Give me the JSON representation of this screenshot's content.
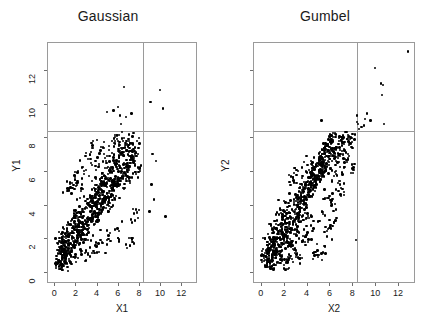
{
  "figure": {
    "background": "#ffffff",
    "point_color": "#000000",
    "axis_color": "#9a9a9a"
  },
  "chart_data": [
    {
      "type": "scatter",
      "title": "Gaussian",
      "xlabel": "X1",
      "ylabel": "Y1",
      "xlim": [
        -0.6,
        13.4
      ],
      "ylim": [
        -0.6,
        13.6
      ],
      "xticks": [
        0,
        2,
        4,
        6,
        8,
        10,
        12
      ],
      "yticks": [
        0,
        2,
        4,
        6,
        8,
        10,
        12
      ],
      "grid": false,
      "legend": "none",
      "annotations": [
        {
          "type": "vline",
          "x": 8.4,
          "color": "#9a9a9a"
        },
        {
          "type": "hline",
          "y": 8.4,
          "color": "#9a9a9a"
        }
      ],
      "n_points": 1000,
      "points": [
        [
          0.5,
          0.6
        ],
        [
          0.6,
          0.4
        ],
        [
          0.7,
          0.9
        ],
        [
          0.4,
          0.7
        ],
        [
          0.9,
          1.1
        ],
        [
          1.1,
          0.8
        ],
        [
          0.8,
          1.3
        ],
        [
          1.2,
          1.0
        ],
        [
          0.3,
          0.5
        ],
        [
          0.6,
          1.2
        ],
        [
          1.0,
          1.5
        ],
        [
          1.4,
          1.1
        ],
        [
          0.9,
          0.6
        ],
        [
          1.3,
          1.6
        ],
        [
          0.7,
          1.8
        ],
        [
          1.6,
          1.2
        ],
        [
          1.1,
          2.0
        ],
        [
          1.8,
          1.5
        ],
        [
          1.5,
          2.2
        ],
        [
          2.0,
          1.8
        ],
        [
          1.2,
          2.4
        ],
        [
          2.2,
          2.0
        ],
        [
          1.7,
          2.6
        ],
        [
          2.4,
          2.2
        ],
        [
          1.4,
          1.4
        ],
        [
          2.1,
          2.5
        ],
        [
          1.9,
          3.0
        ],
        [
          2.6,
          2.4
        ],
        [
          2.3,
          2.8
        ],
        [
          2.8,
          2.6
        ],
        [
          2.0,
          3.2
        ],
        [
          3.0,
          2.9
        ],
        [
          2.5,
          3.4
        ],
        [
          3.2,
          3.0
        ],
        [
          2.7,
          3.6
        ],
        [
          3.4,
          3.2
        ],
        [
          2.9,
          2.2
        ],
        [
          3.6,
          3.4
        ],
        [
          3.1,
          3.8
        ],
        [
          3.8,
          3.6
        ],
        [
          3.3,
          2.6
        ],
        [
          4.0,
          3.9
        ],
        [
          3.5,
          4.2
        ],
        [
          4.2,
          3.5
        ],
        [
          3.7,
          4.4
        ],
        [
          4.4,
          4.0
        ],
        [
          3.9,
          4.6
        ],
        [
          4.6,
          4.2
        ],
        [
          4.1,
          3.1
        ],
        [
          4.8,
          4.5
        ],
        [
          4.3,
          5.0
        ],
        [
          5.0,
          4.4
        ],
        [
          4.5,
          5.2
        ],
        [
          5.2,
          4.8
        ],
        [
          4.7,
          5.4
        ],
        [
          5.4,
          5.0
        ],
        [
          4.9,
          3.8
        ],
        [
          5.6,
          5.3
        ],
        [
          5.1,
          5.8
        ],
        [
          5.8,
          5.1
        ],
        [
          5.3,
          6.0
        ],
        [
          6.0,
          5.6
        ],
        [
          5.5,
          6.2
        ],
        [
          6.2,
          5.4
        ],
        [
          5.7,
          4.4
        ],
        [
          6.4,
          6.1
        ],
        [
          5.9,
          6.6
        ],
        [
          6.6,
          5.9
        ],
        [
          6.1,
          6.8
        ],
        [
          6.8,
          6.4
        ],
        [
          6.3,
          7.0
        ],
        [
          7.0,
          6.2
        ],
        [
          6.5,
          5.0
        ],
        [
          7.2,
          6.9
        ],
        [
          6.7,
          7.4
        ],
        [
          7.4,
          6.7
        ],
        [
          6.9,
          7.6
        ],
        [
          7.6,
          7.2
        ],
        [
          7.1,
          5.6
        ],
        [
          7.8,
          3.5
        ],
        [
          8.1,
          6.2
        ],
        [
          7.3,
          2.0
        ],
        [
          6.0,
          2.0
        ],
        [
          5.0,
          1.9
        ],
        [
          4.0,
          1.5
        ],
        [
          3.0,
          1.2
        ],
        [
          2.0,
          0.9
        ],
        [
          1.0,
          0.5
        ],
        [
          5.6,
          9.6
        ],
        [
          6.0,
          9.8
        ],
        [
          6.2,
          9.3
        ],
        [
          6.6,
          11.0
        ],
        [
          6.3,
          8.8
        ],
        [
          7.3,
          9.4
        ],
        [
          5.0,
          9.5
        ],
        [
          6.8,
          9.2
        ],
        [
          9.1,
          10.1
        ],
        [
          10.0,
          10.8
        ],
        [
          10.3,
          9.7
        ],
        [
          9.3,
          7.0
        ],
        [
          9.6,
          6.6
        ],
        [
          9.2,
          5.2
        ],
        [
          9.4,
          4.3
        ],
        [
          9.0,
          3.6
        ],
        [
          10.5,
          3.3
        ],
        [
          6.4,
          8.3
        ],
        [
          5.9,
          8.1
        ],
        [
          7.0,
          7.9
        ],
        [
          7.5,
          7.3
        ],
        [
          6.1,
          7.6
        ],
        [
          4.6,
          7.4
        ],
        [
          3.6,
          7.5
        ],
        [
          2.2,
          5.3
        ],
        [
          1.5,
          5.3
        ],
        [
          2.8,
          6.0
        ],
        [
          3.2,
          6.7
        ],
        [
          4.2,
          6.3
        ],
        [
          5.2,
          6.9
        ],
        [
          2.5,
          4.8
        ],
        [
          3.9,
          5.6
        ]
      ]
    },
    {
      "type": "scatter",
      "title": "Gumbel",
      "xlabel": "X2",
      "ylabel": "Y2",
      "xlim": [
        -0.6,
        13.4
      ],
      "ylim": [
        -0.6,
        13.6
      ],
      "xticks": [
        0,
        2,
        4,
        6,
        8,
        10,
        12
      ],
      "yticks": [
        0,
        2,
        4,
        6,
        8,
        10,
        12
      ],
      "grid": false,
      "legend": "none",
      "annotations": [
        {
          "type": "vline",
          "x": 8.4,
          "color": "#9a9a9a"
        },
        {
          "type": "hline",
          "y": 8.4,
          "color": "#9a9a9a"
        }
      ],
      "n_points": 1000,
      "points": [
        [
          0.4,
          0.3
        ],
        [
          0.6,
          0.6
        ],
        [
          0.8,
          0.5
        ],
        [
          0.5,
          0.9
        ],
        [
          1.0,
          0.8
        ],
        [
          0.7,
          1.2
        ],
        [
          1.2,
          1.0
        ],
        [
          0.9,
          1.5
        ],
        [
          1.4,
          1.2
        ],
        [
          1.1,
          1.8
        ],
        [
          1.6,
          1.5
        ],
        [
          1.3,
          2.0
        ],
        [
          1.8,
          1.7
        ],
        [
          1.5,
          2.3
        ],
        [
          2.0,
          1.9
        ],
        [
          1.7,
          2.5
        ],
        [
          2.2,
          2.1
        ],
        [
          1.9,
          2.8
        ],
        [
          2.4,
          2.4
        ],
        [
          2.1,
          3.0
        ],
        [
          2.6,
          2.6
        ],
        [
          2.3,
          3.2
        ],
        [
          2.8,
          2.9
        ],
        [
          2.5,
          3.5
        ],
        [
          3.0,
          3.1
        ],
        [
          2.7,
          3.7
        ],
        [
          3.2,
          3.3
        ],
        [
          2.9,
          4.0
        ],
        [
          3.4,
          3.6
        ],
        [
          3.1,
          4.2
        ],
        [
          3.6,
          3.8
        ],
        [
          3.3,
          4.4
        ],
        [
          3.8,
          4.1
        ],
        [
          3.5,
          4.7
        ],
        [
          4.0,
          4.3
        ],
        [
          3.7,
          4.9
        ],
        [
          4.2,
          4.5
        ],
        [
          3.9,
          5.2
        ],
        [
          4.4,
          4.8
        ],
        [
          4.1,
          5.4
        ],
        [
          4.6,
          5.0
        ],
        [
          4.3,
          5.6
        ],
        [
          4.8,
          5.3
        ],
        [
          4.5,
          5.9
        ],
        [
          5.0,
          5.5
        ],
        [
          4.7,
          6.1
        ],
        [
          5.2,
          5.7
        ],
        [
          4.9,
          6.3
        ],
        [
          5.4,
          6.0
        ],
        [
          5.1,
          6.6
        ],
        [
          5.6,
          6.2
        ],
        [
          5.3,
          6.8
        ],
        [
          5.8,
          6.4
        ],
        [
          5.5,
          7.0
        ],
        [
          6.0,
          6.7
        ],
        [
          5.7,
          7.3
        ],
        [
          6.2,
          6.9
        ],
        [
          5.9,
          7.5
        ],
        [
          6.4,
          7.1
        ],
        [
          6.1,
          7.7
        ],
        [
          6.6,
          7.4
        ],
        [
          6.3,
          8.0
        ],
        [
          6.8,
          7.6
        ],
        [
          6.5,
          8.2
        ],
        [
          7.0,
          7.8
        ],
        [
          6.7,
          6.5
        ],
        [
          7.2,
          8.1
        ],
        [
          6.9,
          5.4
        ],
        [
          7.4,
          8.3
        ],
        [
          7.1,
          7.2
        ],
        [
          7.6,
          7.0
        ],
        [
          7.3,
          6.2
        ],
        [
          7.8,
          7.9
        ],
        [
          7.5,
          8.3
        ],
        [
          8.0,
          7.7
        ],
        [
          8.2,
          6.4
        ],
        [
          8.3,
          1.9
        ],
        [
          5.3,
          9.0
        ],
        [
          8.4,
          9.3
        ],
        [
          8.4,
          8.9
        ],
        [
          8.5,
          8.8
        ],
        [
          8.8,
          8.6
        ],
        [
          9.1,
          9.1
        ],
        [
          9.3,
          9.4
        ],
        [
          9.6,
          9.0
        ],
        [
          10.0,
          12.1
        ],
        [
          10.5,
          11.2
        ],
        [
          10.7,
          11.1
        ],
        [
          10.6,
          10.5
        ],
        [
          10.8,
          8.8
        ],
        [
          12.9,
          13.1
        ],
        [
          8.6,
          8.5
        ],
        [
          9.0,
          8.7
        ],
        [
          6.0,
          2.6
        ],
        [
          5.6,
          1.5
        ],
        [
          4.8,
          1.0
        ],
        [
          3.4,
          0.8
        ],
        [
          2.4,
          0.6
        ],
        [
          1.2,
          0.4
        ],
        [
          2.0,
          0.2
        ],
        [
          3.0,
          1.4
        ],
        [
          4.0,
          2.2
        ],
        [
          5.0,
          3.0
        ],
        [
          6.2,
          4.0
        ],
        [
          2.8,
          5.6
        ],
        [
          3.6,
          6.2
        ],
        [
          4.4,
          6.6
        ],
        [
          2.0,
          4.2
        ],
        [
          1.6,
          3.4
        ],
        [
          1.0,
          2.6
        ],
        [
          6.6,
          5.8
        ],
        [
          7.0,
          5.0
        ],
        [
          5.8,
          4.4
        ],
        [
          4.2,
          3.2
        ],
        [
          3.2,
          2.4
        ],
        [
          2.6,
          1.6
        ],
        [
          1.4,
          1.0
        ],
        [
          0.8,
          2.0
        ],
        [
          0.6,
          1.4
        ],
        [
          7.7,
          8.0
        ]
      ]
    }
  ]
}
